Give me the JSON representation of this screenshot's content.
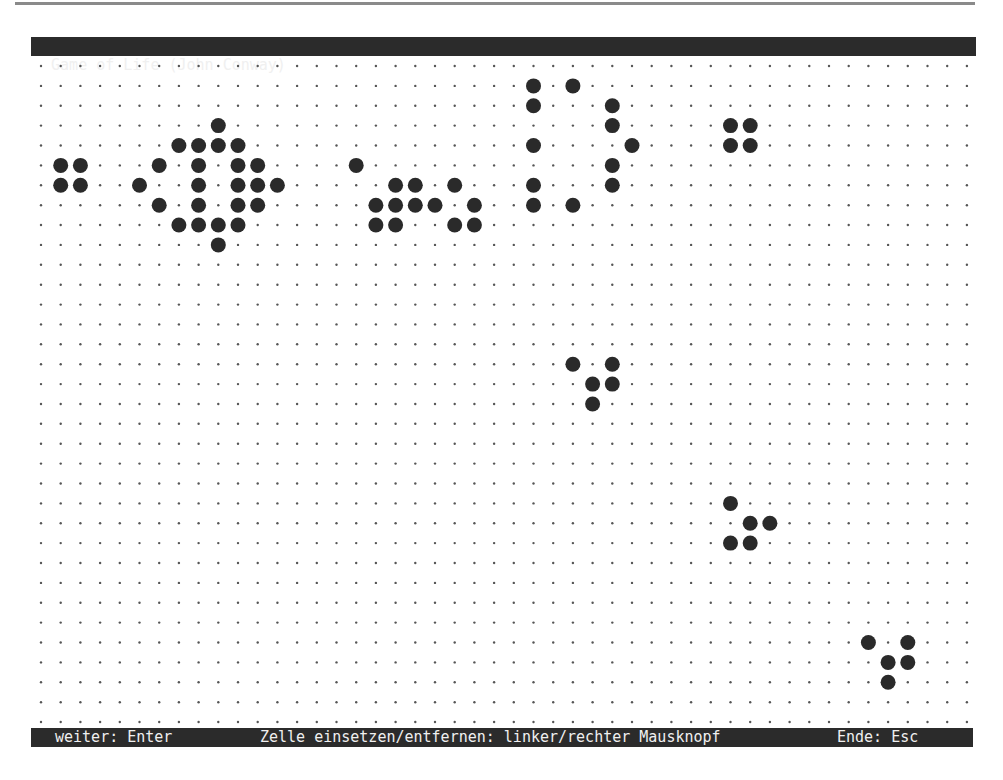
{
  "window": {
    "title": "Game of Life (John Conway)"
  },
  "status_bar": {
    "continue_hint": "weiter: Enter",
    "cell_hint": "Zelle einsetzen/entfernen: linker/rechter Mausknopf",
    "exit_hint": "Ende: Esc"
  },
  "board": {
    "columns": 48,
    "rows": 34,
    "origin_x": 41,
    "origin_y": 66,
    "cell_w": 19.7,
    "cell_h": 19.88,
    "dot_color": "#555555",
    "cell_color": "#2a2a2a",
    "live_cells": [
      [
        3,
        9
      ],
      [
        4,
        7
      ],
      [
        4,
        8
      ],
      [
        4,
        9
      ],
      [
        4,
        10
      ],
      [
        5,
        1
      ],
      [
        5,
        2
      ],
      [
        5,
        6
      ],
      [
        5,
        8
      ],
      [
        5,
        10
      ],
      [
        5,
        11
      ],
      [
        6,
        1
      ],
      [
        6,
        2
      ],
      [
        6,
        5
      ],
      [
        6,
        8
      ],
      [
        6,
        10
      ],
      [
        6,
        11
      ],
      [
        6,
        12
      ],
      [
        7,
        6
      ],
      [
        7,
        8
      ],
      [
        7,
        10
      ],
      [
        7,
        11
      ],
      [
        8,
        7
      ],
      [
        8,
        8
      ],
      [
        8,
        9
      ],
      [
        8,
        10
      ],
      [
        9,
        9
      ],
      [
        1,
        25
      ],
      [
        1,
        27
      ],
      [
        2,
        25
      ],
      [
        2,
        29
      ],
      [
        3,
        29
      ],
      [
        4,
        25
      ],
      [
        4,
        30
      ],
      [
        5,
        16
      ],
      [
        5,
        29
      ],
      [
        6,
        18
      ],
      [
        6,
        19
      ],
      [
        6,
        21
      ],
      [
        6,
        25
      ],
      [
        6,
        29
      ],
      [
        7,
        17
      ],
      [
        7,
        18
      ],
      [
        7,
        19
      ],
      [
        7,
        20
      ],
      [
        7,
        22
      ],
      [
        7,
        25
      ],
      [
        7,
        27
      ],
      [
        8,
        17
      ],
      [
        8,
        18
      ],
      [
        8,
        21
      ],
      [
        8,
        22
      ],
      [
        3,
        35
      ],
      [
        3,
        36
      ],
      [
        4,
        35
      ],
      [
        4,
        36
      ],
      [
        15,
        27
      ],
      [
        15,
        29
      ],
      [
        16,
        28
      ],
      [
        16,
        29
      ],
      [
        17,
        28
      ],
      [
        22,
        35
      ],
      [
        23,
        36
      ],
      [
        23,
        37
      ],
      [
        24,
        35
      ],
      [
        24,
        36
      ],
      [
        29,
        42
      ],
      [
        29,
        44
      ],
      [
        30,
        43
      ],
      [
        30,
        44
      ],
      [
        31,
        43
      ]
    ]
  }
}
